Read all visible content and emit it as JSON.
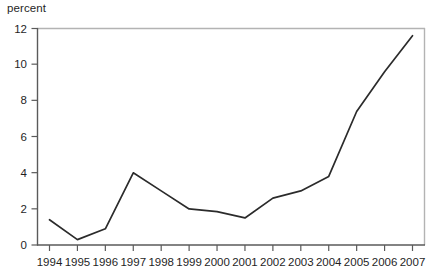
{
  "chart_data": {
    "type": "line",
    "title": "",
    "subtitle": "",
    "xlabel": "",
    "ylabel": "percent",
    "ylim": [
      0,
      12
    ],
    "yticks": [
      0,
      2,
      4,
      6,
      8,
      10,
      12
    ],
    "ytick_labels": [
      "0",
      "2",
      "4",
      "6",
      "8",
      "10",
      "12"
    ],
    "grid": false,
    "legend": false,
    "legend_position": "none",
    "categories": [
      "1994",
      "1995",
      "1996",
      "1997",
      "1998",
      "1999",
      "2000",
      "2001",
      "2002",
      "2003",
      "2004",
      "2005",
      "2006",
      "2007"
    ],
    "x": [
      1994,
      1995,
      1996,
      1997,
      1998,
      1999,
      2000,
      2001,
      2002,
      2003,
      2004,
      2005,
      2006,
      2007
    ],
    "values": [
      1.4,
      0.3,
      0.9,
      4.0,
      3.0,
      2.0,
      1.85,
      1.5,
      2.6,
      3.0,
      3.8,
      7.4,
      9.6,
      11.6
    ],
    "series": [
      {
        "name": "percent",
        "values": [
          1.4,
          0.3,
          0.9,
          4.0,
          3.0,
          2.0,
          1.85,
          1.5,
          2.6,
          3.0,
          3.8,
          7.4,
          9.6,
          11.6
        ]
      }
    ],
    "annotations": []
  },
  "style": {
    "line_color": "#2b2b2b",
    "axis_color": "#4d4d4d",
    "frame_color": "#b3b3b3",
    "text_color": "#1f1f1f",
    "background": "#ffffff"
  }
}
